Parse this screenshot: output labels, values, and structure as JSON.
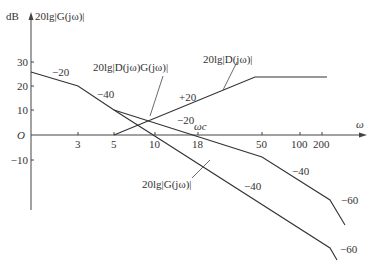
{
  "axes": {
    "y_unit": "dB",
    "y_title": "20lg|G(jω)|",
    "x_title": "ω",
    "origin": "O",
    "y_ticks": [
      {
        "label": "30",
        "value": 30,
        "py": 62
      },
      {
        "label": "20",
        "value": 20,
        "py": 86
      },
      {
        "label": "10",
        "value": 10,
        "py": 110
      },
      {
        "label": "-10",
        "value": -10,
        "py": 160
      }
    ],
    "x_ticks": [
      {
        "label": "3",
        "value": 3,
        "px": 78
      },
      {
        "label": "5",
        "value": 5,
        "px": 114
      },
      {
        "label": "10",
        "value": 10,
        "px": 155
      },
      {
        "label": "18",
        "value": 18,
        "px": 198
      },
      {
        "label": "50",
        "value": 50,
        "px": 262
      },
      {
        "label": "100",
        "value": 100,
        "px": 300
      },
      {
        "label": "200",
        "value": 200,
        "px": 322
      }
    ],
    "crossover_label": "ωc"
  },
  "curves": {
    "G": {
      "label": "20lg|G(jω)|",
      "slopes": [
        "-20",
        "-40",
        "-40",
        "-60"
      ],
      "points": [
        [
          31,
          72
        ],
        [
          78,
          86
        ],
        [
          114,
          110
        ],
        [
          330,
          248
        ],
        [
          337,
          260
        ]
      ]
    },
    "DG": {
      "label": "20lg|D(jω)G(jω)|",
      "slopes": [
        "-20",
        "-40",
        "-60"
      ],
      "points": [
        [
          114,
          110
        ],
        [
          262,
          157
        ],
        [
          330,
          200
        ],
        [
          345,
          225
        ]
      ]
    },
    "D": {
      "label": "20lg|D(jω)|",
      "slopes": [
        "+20"
      ],
      "points": [
        [
          114,
          135
        ],
        [
          255,
          77
        ],
        [
          327,
          77
        ]
      ]
    }
  },
  "slope_labels": [
    {
      "text": "-20",
      "x": 52,
      "y": 66
    },
    {
      "text": "-40",
      "x": 97,
      "y": 88
    },
    {
      "text": "+20",
      "x": 179,
      "y": 91
    },
    {
      "text": "-20",
      "x": 177,
      "y": 114
    },
    {
      "text": "-40",
      "x": 292,
      "y": 165
    },
    {
      "text": "-40",
      "x": 244,
      "y": 180
    },
    {
      "text": "-60",
      "x": 341,
      "y": 194
    },
    {
      "text": "-60",
      "x": 340,
      "y": 243
    }
  ],
  "chart_data": {
    "type": "line",
    "xlabel": "ω",
    "ylabel": "dB  20lg|G(jω)|",
    "x_scale": "log",
    "x_ticks": [
      3,
      5,
      10,
      18,
      50,
      100,
      200
    ],
    "y_ticks": [
      30,
      20,
      10,
      0,
      -10
    ],
    "annotations": [
      "ωc at 18",
      "slope -20",
      "slope -40",
      "slope +20",
      "slope -60"
    ],
    "series": [
      {
        "name": "20lg|G(jω)|",
        "x": [
          1,
          3,
          5,
          200,
          250
        ],
        "y": [
          26,
          20,
          11,
          -52,
          -58
        ],
        "slopes": [
          -20,
          -40,
          -60
        ]
      },
      {
        "name": "20lg|D(jω)G(jω)|",
        "x": [
          5,
          50,
          200,
          260
        ],
        "y": [
          11,
          -9,
          -27,
          -37
        ],
        "slopes": [
          -20,
          -40,
          -60
        ]
      },
      {
        "name": "20lg|D(jω)|",
        "x": [
          5,
          50,
          200
        ],
        "y": [
          0,
          24,
          24
        ],
        "slopes": [
          20,
          0
        ]
      }
    ],
    "ylim": [
      -30,
      35
    ],
    "grid": false,
    "legend": "inline callouts"
  }
}
